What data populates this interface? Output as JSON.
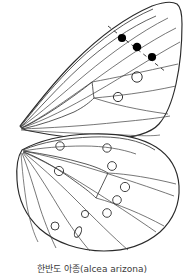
{
  "figure": {
    "caption": "한반도 아종(alcea arizona)",
    "caption_korean": "한반도 아종",
    "caption_latin": "(alcea arizona)",
    "background_color": "#ffffff",
    "ink_color": "#1a1a1a",
    "vein_color": "#4a4a4a",
    "spot_fill_color": "#000000",
    "spot_outline_color": "#444444"
  },
  "wings": {
    "forewing": {
      "label": "forewing",
      "base_point": "20,126",
      "solid_spot_count": 3,
      "open_spot_count": 2,
      "has_dashed_reference_line": true
    },
    "hindwing": {
      "label": "hindwing",
      "base_point": "22,150",
      "open_spot_count": 9,
      "elongated_spot_count": 1
    }
  },
  "markers": {
    "solid_spots": [
      {
        "name": "solid-spot-1",
        "cx": 122,
        "cy": 38,
        "r": 4.1
      },
      {
        "name": "solid-spot-2",
        "cx": 137,
        "cy": 47,
        "r": 4.3
      },
      {
        "name": "solid-spot-3",
        "cx": 152,
        "cy": 57,
        "r": 4.1
      }
    ],
    "open_spots_forewing": [
      {
        "name": "open-spot-fw-1",
        "cx": 137,
        "cy": 77,
        "r": 5.2
      },
      {
        "name": "open-spot-fw-2",
        "cx": 118,
        "cy": 97,
        "r": 4.6
      }
    ],
    "open_spots_hindwing": [
      {
        "name": "open-spot-hw-1",
        "cx": 60,
        "cy": 146,
        "r": 4.2
      },
      {
        "name": "open-spot-hw-2",
        "cx": 107,
        "cy": 148,
        "r": 4.2
      },
      {
        "name": "open-spot-hw-3",
        "cx": 112,
        "cy": 166,
        "r": 4.4
      },
      {
        "name": "open-spot-hw-4",
        "cx": 59,
        "cy": 171,
        "r": 4.6
      },
      {
        "name": "open-spot-hw-5",
        "cx": 125,
        "cy": 187,
        "r": 4.6
      },
      {
        "name": "open-spot-hw-6",
        "cx": 117,
        "cy": 200,
        "r": 4.3
      },
      {
        "name": "open-spot-hw-7",
        "cx": 107,
        "cy": 213,
        "r": 4.3
      },
      {
        "name": "open-spot-hw-8",
        "cx": 85,
        "cy": 214,
        "r": 3.6
      },
      {
        "name": "open-spot-hw-9",
        "cx": 55,
        "cy": 226,
        "r": 4.0
      }
    ],
    "elongated_spots": [
      {
        "name": "elongated-spot-hw-1",
        "cx": 78,
        "cy": 232,
        "rx": 3.0,
        "ry": 5.6,
        "rotate": 25
      }
    ],
    "dashed_line": {
      "name": "spot-reference-dashed-line",
      "from": "108,26",
      "to": "166,72"
    }
  }
}
